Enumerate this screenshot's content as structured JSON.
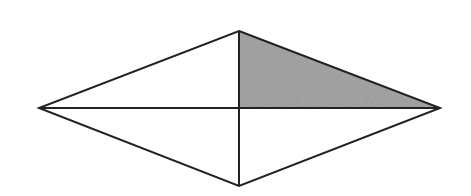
{
  "diagram": {
    "type": "rhombus-with-diagonals",
    "vertices": {
      "top": [
        239,
        31
      ],
      "right": [
        440,
        108
      ],
      "bottom": [
        239,
        186
      ],
      "left": [
        39,
        108
      ]
    },
    "center": [
      239,
      108
    ],
    "shaded_region": {
      "description": "upper-right triangle formed by top vertex, center, and right vertex",
      "points": [
        [
          239,
          31
        ],
        [
          440,
          108
        ],
        [
          239,
          108
        ]
      ],
      "fill": "#9c9c9c"
    },
    "stroke_color": "#222222",
    "stroke_width": 2,
    "background": "#ffffff"
  }
}
